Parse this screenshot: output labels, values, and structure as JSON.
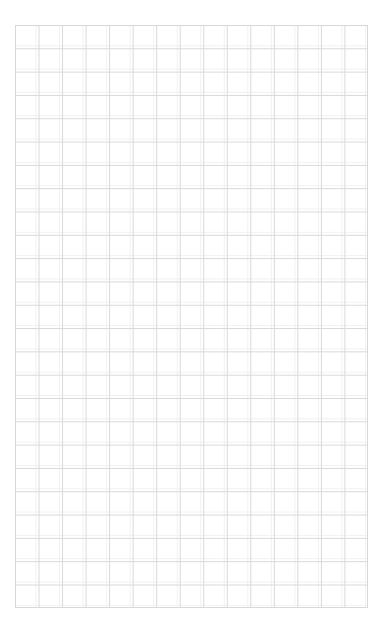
{
  "page": {
    "width": 384,
    "height": 631,
    "background_color": "#ffffff",
    "content_text": ""
  },
  "grid": {
    "name": "graph-paper-grid",
    "left": 15,
    "top": 25,
    "width": 353,
    "height": 583,
    "columns": 15,
    "rows": 25,
    "cell_width": 23.53,
    "cell_height": 23.32,
    "line_color": "#d8d8d8",
    "ghost_line_color": "#f1f1f1",
    "line_width": 1,
    "border_color": "#d8d8d8"
  },
  "margins": {
    "top_label": "",
    "left_label": "",
    "right_label": "",
    "bottom_label": ""
  }
}
